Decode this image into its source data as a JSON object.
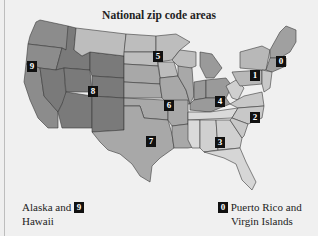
{
  "title": "National zip code areas",
  "colors": {
    "background": "#f0f0f0",
    "zone_light": "#d6d6d6",
    "zone_mid_light": "#bdbdbd",
    "zone_mid": "#a8a8a8",
    "zone_dark": "#8c8c8c",
    "zone_darker": "#7a7a7a",
    "border": "#333333",
    "badge_bg": "#111111",
    "badge_fg": "#ffffff"
  },
  "zones": [
    {
      "id": "0",
      "label": "0",
      "region": "New England"
    },
    {
      "id": "1",
      "label": "1",
      "region": "New York / Pennsylvania"
    },
    {
      "id": "2",
      "label": "2",
      "region": "Mid-Atlantic / Carolinas"
    },
    {
      "id": "3",
      "label": "3",
      "region": "Southeast"
    },
    {
      "id": "4",
      "label": "4",
      "region": "Ohio Valley / Great Lakes"
    },
    {
      "id": "5",
      "label": "5",
      "region": "Upper Midwest"
    },
    {
      "id": "6",
      "label": "6",
      "region": "Central Plains"
    },
    {
      "id": "7",
      "label": "7",
      "region": "South Central"
    },
    {
      "id": "8",
      "label": "8",
      "region": "Mountain"
    },
    {
      "id": "9",
      "label": "9",
      "region": "Pacific"
    }
  ],
  "legend": {
    "alaska_hawaii": {
      "text_line1": "Alaska and",
      "text_line2": "Hawaii",
      "badge": "9"
    },
    "puerto_rico": {
      "text_line1": "Puerto Rico and",
      "text_line2": "Virgin Islands",
      "badge": "0"
    }
  }
}
